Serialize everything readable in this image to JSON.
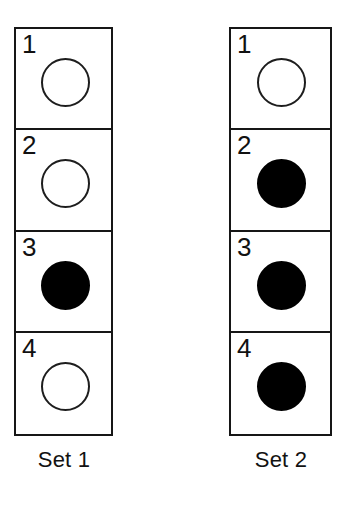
{
  "figure": {
    "background_color": "#ffffff",
    "line_color": "#161616",
    "fill_color": "#000000",
    "open_fill_color": "#ffffff"
  },
  "sets": [
    {
      "id": "set-1",
      "caption": "Set 1",
      "cells": [
        {
          "number": "1",
          "state": "open"
        },
        {
          "number": "2",
          "state": "open"
        },
        {
          "number": "3",
          "state": "filled"
        },
        {
          "number": "4",
          "state": "open"
        }
      ]
    },
    {
      "id": "set-2",
      "caption": "Set 2",
      "cells": [
        {
          "number": "1",
          "state": "open"
        },
        {
          "number": "2",
          "state": "filled"
        },
        {
          "number": "3",
          "state": "filled"
        },
        {
          "number": "4",
          "state": "filled"
        }
      ]
    }
  ]
}
